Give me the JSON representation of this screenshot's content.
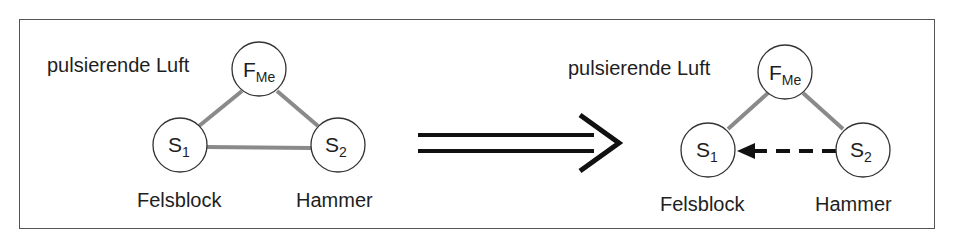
{
  "figure": {
    "left_diagram": {
      "context_label": "pulsierende Luft",
      "nodes": {
        "top": {
          "main": "F",
          "sub": "Me"
        },
        "left": {
          "main": "S",
          "sub": "1"
        },
        "right": {
          "main": "S",
          "sub": "2"
        }
      },
      "labels": {
        "left": "Felsblock",
        "right": "Hammer"
      },
      "edges": [
        {
          "from": "F_Me",
          "to": "S1",
          "style": "solid-gray"
        },
        {
          "from": "F_Me",
          "to": "S2",
          "style": "solid-gray"
        },
        {
          "from": "S1",
          "to": "S2",
          "style": "solid-gray"
        }
      ]
    },
    "transition_arrow": {
      "type": "implies-double-arrow"
    },
    "right_diagram": {
      "context_label": "pulsierende Luft",
      "nodes": {
        "top": {
          "main": "F",
          "sub": "Me"
        },
        "left": {
          "main": "S",
          "sub": "1"
        },
        "right": {
          "main": "S",
          "sub": "2"
        }
      },
      "labels": {
        "left": "Felsblock",
        "right": "Hammer"
      },
      "edges": [
        {
          "from": "F_Me",
          "to": "S1",
          "style": "solid-gray"
        },
        {
          "from": "F_Me",
          "to": "S2",
          "style": "solid-gray"
        },
        {
          "from": "S2",
          "to": "S1",
          "style": "dashed-arrow-black"
        }
      ]
    },
    "colors": {
      "edge_gray": "#8a8a8a",
      "ink": "#1e1e1e",
      "frame": "#555555"
    }
  }
}
